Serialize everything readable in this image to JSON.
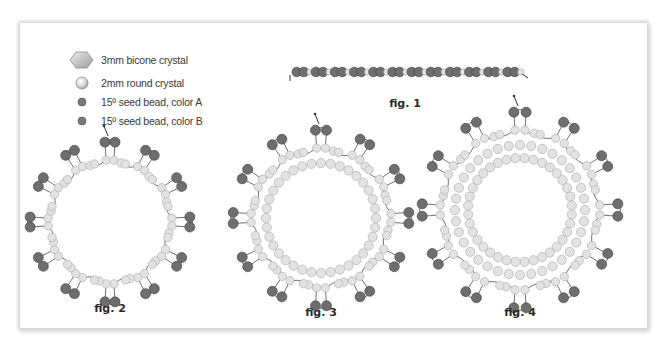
{
  "colors": {
    "seed_dark": "#6e6e6e",
    "seed_dark_stroke": "#3c3c3c",
    "crystal_light": "#e2e2e2",
    "crystal_stroke": "#a8a8a8",
    "thread": "#333333",
    "bicone_fill": "#c9c9c9",
    "bicone_stroke": "#8a8a8a"
  },
  "legend": {
    "items": [
      {
        "icon": "bicone-crystal-icon",
        "label": "3mm bicone crystal"
      },
      {
        "icon": "round-crystal-icon",
        "label": "2mm round crystal"
      },
      {
        "icon": "seed-bead-a-icon",
        "label": "15º seed bead, color A"
      },
      {
        "icon": "seed-bead-b-icon",
        "label": "15º seed bead, color B"
      }
    ]
  },
  "figures": [
    {
      "id": "fig1",
      "label": "fig. 1",
      "type": "strip",
      "x0": 292,
      "x1": 522,
      "y": 72,
      "units": 12,
      "label_pos": [
        405,
        107
      ]
    },
    {
      "id": "fig2",
      "label": "fig. 2",
      "type": "ring",
      "cx": 110,
      "cy": 222,
      "lobes": 12,
      "r_outer": 80,
      "r_mid": 62,
      "inner_rows": 0,
      "label_pos": [
        110,
        312
      ]
    },
    {
      "id": "fig3",
      "label": "fig. 3",
      "type": "ring",
      "cx": 321,
      "cy": 218,
      "lobes": 12,
      "r_outer": 88,
      "r_mid": 70,
      "inner_rows": 1,
      "label_pos": [
        321,
        316
      ]
    },
    {
      "id": "fig4",
      "label": "fig. 4",
      "type": "ring",
      "cx": 520,
      "cy": 210,
      "lobes": 12,
      "r_outer": 98,
      "r_mid": 80,
      "inner_rows": 2,
      "label_pos": [
        520,
        316
      ]
    }
  ]
}
